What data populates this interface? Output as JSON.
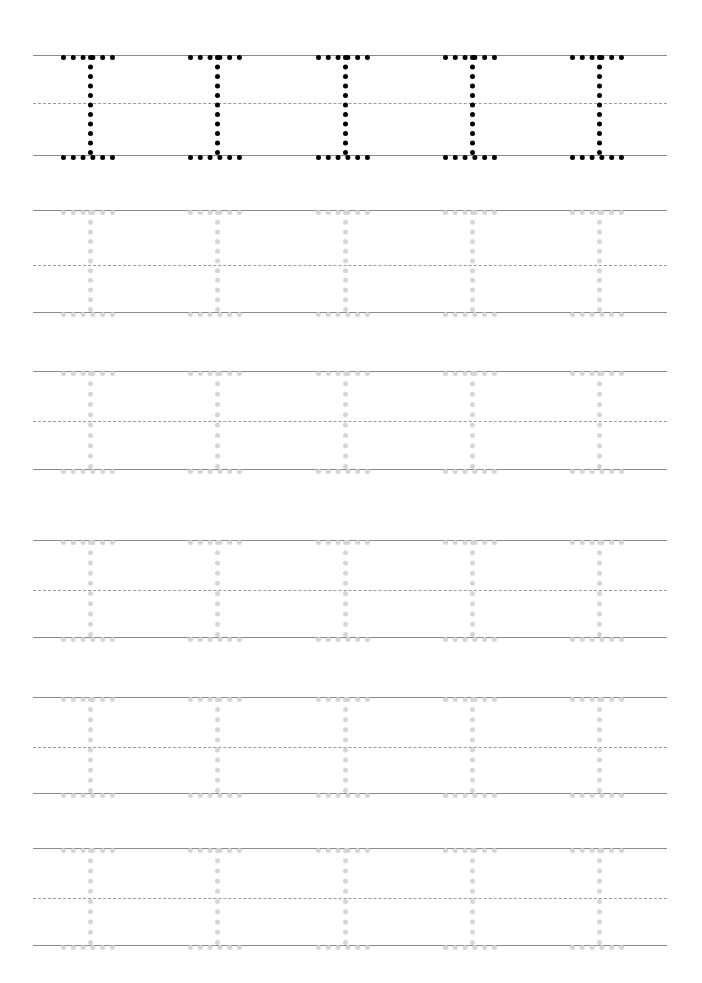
{
  "worksheet": {
    "title": "Letter I Tracing Practice Worksheet",
    "letter": "I",
    "letter_case": "uppercase",
    "page_width": 702,
    "page_height": 983,
    "background_color": "#ffffff",
    "margin_left": 33,
    "margin_right": 667,
    "rule_line_color": "#8a8a8a",
    "midline_color": "#9a9a9a",
    "model_stroke_color": "#000000",
    "trace_stroke_color": "#d6d6d6",
    "letters_per_row": 5,
    "row_count": 6,
    "letter_x_positions": [
      88,
      215,
      343,
      470,
      597
    ],
    "letter_half_width": 27,
    "rows": [
      {
        "index": 1,
        "style": "dark",
        "label": "model-row",
        "top_line_y": 55,
        "mid_line_y": 103,
        "base_line_y": 155
      },
      {
        "index": 2,
        "style": "faint",
        "label": "trace-row-1",
        "top_line_y": 210,
        "mid_line_y": 265,
        "base_line_y": 312
      },
      {
        "index": 3,
        "style": "faint",
        "label": "trace-row-2",
        "top_line_y": 371,
        "mid_line_y": 421,
        "base_line_y": 469
      },
      {
        "index": 4,
        "style": "faint",
        "label": "trace-row-3",
        "top_line_y": 540,
        "mid_line_y": 590,
        "base_line_y": 637
      },
      {
        "index": 5,
        "style": "faint",
        "label": "trace-row-4",
        "top_line_y": 697,
        "mid_line_y": 747,
        "base_line_y": 793
      },
      {
        "index": 6,
        "style": "faint",
        "label": "trace-row-5",
        "top_line_y": 848,
        "mid_line_y": 898,
        "base_line_y": 945
      }
    ]
  }
}
